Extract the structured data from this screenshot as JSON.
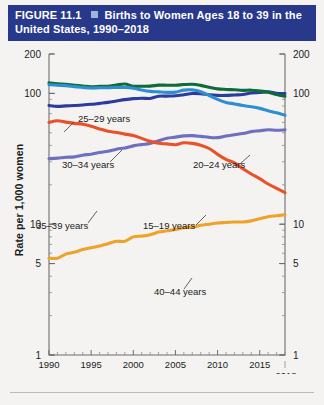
{
  "header": {
    "figure_number": "FIGURE 11.1",
    "bullet_icon": "square-bullet",
    "title": "Births to Women Ages 18 to 39 in the United States, 1990–2018"
  },
  "axes": {
    "ylabel": "Rate per 1,000 women",
    "y_ticks_left": [
      "200",
      "100",
      "10",
      "5",
      "1"
    ],
    "y_ticks_right": [
      "200",
      "100",
      "10",
      "5",
      "1"
    ],
    "x_ticks": [
      "1990",
      "1995",
      "2000",
      "2005",
      "2010",
      "2015"
    ],
    "x_last_tick": "2018"
  },
  "chart_data": {
    "type": "line",
    "title": "Births to Women Ages 18 to 39 in the United States, 1990–2018",
    "xlabel": "",
    "ylabel": "Rate per 1,000 women",
    "yscale": "log",
    "ylim": [
      1,
      200
    ],
    "xlim": [
      1990,
      2018
    ],
    "grid": false,
    "legend": "inline-annotations",
    "x": [
      1990,
      1991,
      1992,
      1993,
      1994,
      1995,
      1996,
      1997,
      1998,
      1999,
      2000,
      2001,
      2002,
      2003,
      2004,
      2005,
      2006,
      2007,
      2008,
      2009,
      2010,
      2011,
      2012,
      2013,
      2014,
      2015,
      2016,
      2017,
      2018
    ],
    "series": [
      {
        "name": "20–24 years",
        "color": "#2b8fd0",
        "label_x": 2009.2,
        "values": [
          116.5,
          115.3,
          114.6,
          112.6,
          111.1,
          109.8,
          110.4,
          110.4,
          111.2,
          111.0,
          109.7,
          106.2,
          103.6,
          102.6,
          101.8,
          102.2,
          105.9,
          106.3,
          103.0,
          96.3,
          90.0,
          85.3,
          83.1,
          80.7,
          79.0,
          76.8,
          73.7,
          71.0,
          68.0
        ]
      },
      {
        "name": "25–29 years",
        "color": "#0f6b3a",
        "label_x": 1993.6,
        "values": [
          120.2,
          118.2,
          117.4,
          115.5,
          113.9,
          112.2,
          113.1,
          113.4,
          115.9,
          117.8,
          113.5,
          113.4,
          113.6,
          115.6,
          115.5,
          115.5,
          116.8,
          117.5,
          115.1,
          111.5,
          108.3,
          107.2,
          106.5,
          105.5,
          105.8,
          104.3,
          102.1,
          98.0,
          95.0
        ]
      },
      {
        "name": "30–34 years",
        "color": "#2b3b9e",
        "label_x": 1997.5,
        "values": [
          80.8,
          79.5,
          80.2,
          80.8,
          81.5,
          82.5,
          83.9,
          85.3,
          87.4,
          89.6,
          91.2,
          91.9,
          91.5,
          95.1,
          95.3,
          95.8,
          97.7,
          99.9,
          99.3,
          97.5,
          96.5,
          96.5,
          97.3,
          98.0,
          100.8,
          101.5,
          102.6,
          100.3,
          99.7
        ]
      },
      {
        "name": "35–39 years",
        "color": "#6f6fc0",
        "label_x": 1995.8,
        "values": [
          31.7,
          32.0,
          32.5,
          32.7,
          33.7,
          34.3,
          35.3,
          36.1,
          37.4,
          38.3,
          39.7,
          40.6,
          41.4,
          43.4,
          45.4,
          46.3,
          47.3,
          47.5,
          46.9,
          46.1,
          45.9,
          47.2,
          48.3,
          49.3,
          51.0,
          51.8,
          52.7,
          52.2,
          52.6
        ]
      },
      {
        "name": "15–19 years",
        "color": "#e8512a",
        "label_x": 2007.8,
        "values": [
          59.9,
          61.8,
          60.3,
          59.0,
          58.2,
          56.0,
          53.5,
          51.3,
          50.3,
          48.8,
          47.7,
          45.3,
          43.0,
          41.6,
          41.1,
          40.5,
          41.9,
          41.5,
          40.2,
          37.9,
          34.2,
          31.3,
          29.4,
          26.5,
          24.2,
          22.3,
          20.3,
          18.8,
          17.4
        ]
      },
      {
        "name": "40–44 years",
        "color": "#efa229",
        "label_x": 2008.6,
        "values": [
          5.5,
          5.5,
          5.9,
          6.1,
          6.4,
          6.6,
          6.8,
          7.1,
          7.4,
          7.4,
          8.0,
          8.1,
          8.3,
          8.7,
          8.9,
          9.1,
          9.4,
          9.5,
          9.8,
          10.0,
          10.2,
          10.3,
          10.4,
          10.4,
          10.6,
          11.0,
          11.4,
          11.6,
          11.8
        ]
      }
    ]
  }
}
